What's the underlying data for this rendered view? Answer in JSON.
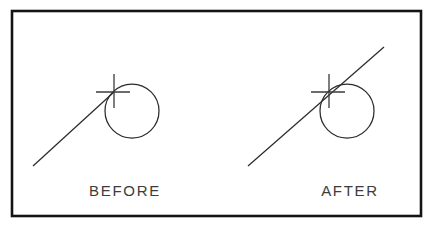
{
  "figure": {
    "background_color": "#ffffff",
    "frame": {
      "stroke_color": "#141414",
      "stroke_width": 2.6,
      "x": 12,
      "y": 11,
      "width": 409,
      "height": 205
    },
    "line_color": "#2b2b2b",
    "crosshair_color": "#3a3a3a",
    "text_color": "#3c3c3c"
  },
  "panels": [
    {
      "id": "before",
      "caption": "BEFORE",
      "caption_x": 125,
      "caption_y": 196,
      "circle": {
        "cx": 132,
        "cy": 111,
        "r": 27
      },
      "line": {
        "x1": 33,
        "y1": 166,
        "x2": 114,
        "y2": 92
      },
      "crosshair": {
        "cx": 114,
        "cy": 92,
        "arm_left": 18,
        "arm_right": 16,
        "arm_up": 18,
        "arm_down": 16
      }
    },
    {
      "id": "after",
      "caption": "AFTER",
      "caption_x": 350,
      "caption_y": 196,
      "circle": {
        "cx": 347,
        "cy": 111,
        "r": 27
      },
      "line": {
        "x1": 248,
        "y1": 166,
        "x2": 384,
        "y2": 47
      },
      "crosshair": {
        "cx": 329,
        "cy": 92,
        "arm_left": 18,
        "arm_right": 16,
        "arm_up": 18,
        "arm_down": 16
      }
    }
  ],
  "chart_data": {
    "type": "diagram",
    "annotations": [
      "BEFORE",
      "AFTER"
    ]
  }
}
